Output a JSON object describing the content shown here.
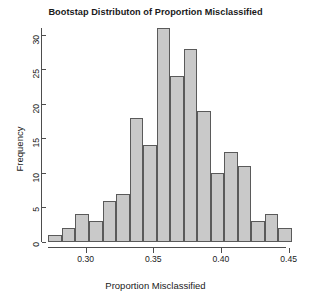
{
  "chart_data": {
    "type": "bar",
    "title": "Bootstap Distributon of Proportion Misclassified",
    "xlabel": "Proportion Misclassified",
    "ylabel": "Frequency",
    "grid": false,
    "legend": "none",
    "bin_width": 0.01,
    "bin_edges": [
      0.2725,
      0.2825,
      0.2925,
      0.3025,
      0.3125,
      0.3225,
      0.3325,
      0.3425,
      0.3525,
      0.3625,
      0.3725,
      0.3825,
      0.3925,
      0.4025,
      0.4125,
      0.4225,
      0.4325,
      0.4425,
      0.4525
    ],
    "categories": [
      "0.2725-0.2825",
      "0.2825-0.2925",
      "0.2925-0.3025",
      "0.3025-0.3125",
      "0.3125-0.3225",
      "0.3225-0.3325",
      "0.3325-0.3425",
      "0.3425-0.3525",
      "0.3525-0.3625",
      "0.3625-0.3725",
      "0.3725-0.3825",
      "0.3825-0.3925",
      "0.3925-0.4025",
      "0.4025-0.4125",
      "0.4125-0.4225",
      "0.4225-0.4325",
      "0.4325-0.4425",
      "0.4425-0.4525"
    ],
    "values": [
      1,
      2,
      4,
      3,
      6,
      7,
      18,
      14,
      31,
      24,
      28,
      19,
      10,
      13,
      11,
      3,
      4,
      2
    ],
    "xlim": [
      0.27,
      0.4525
    ],
    "ylim": [
      0,
      31
    ],
    "yticks": [
      0,
      5,
      10,
      15,
      20,
      25,
      30
    ],
    "ytick_labels": [
      "0",
      "5",
      "10",
      "15",
      "20",
      "25",
      "30"
    ],
    "xticks": [
      0.3,
      0.35,
      0.4,
      0.45
    ],
    "xtick_labels": [
      "0.30",
      "0.35",
      "0.40",
      "0.45"
    ],
    "bar_fill_color": "#c9c9c9",
    "bar_border_color": "#5a5a5a",
    "axis_color": "#4d4d4d",
    "text_color": "#1a1a1a",
    "background_color": "#ffffff"
  }
}
